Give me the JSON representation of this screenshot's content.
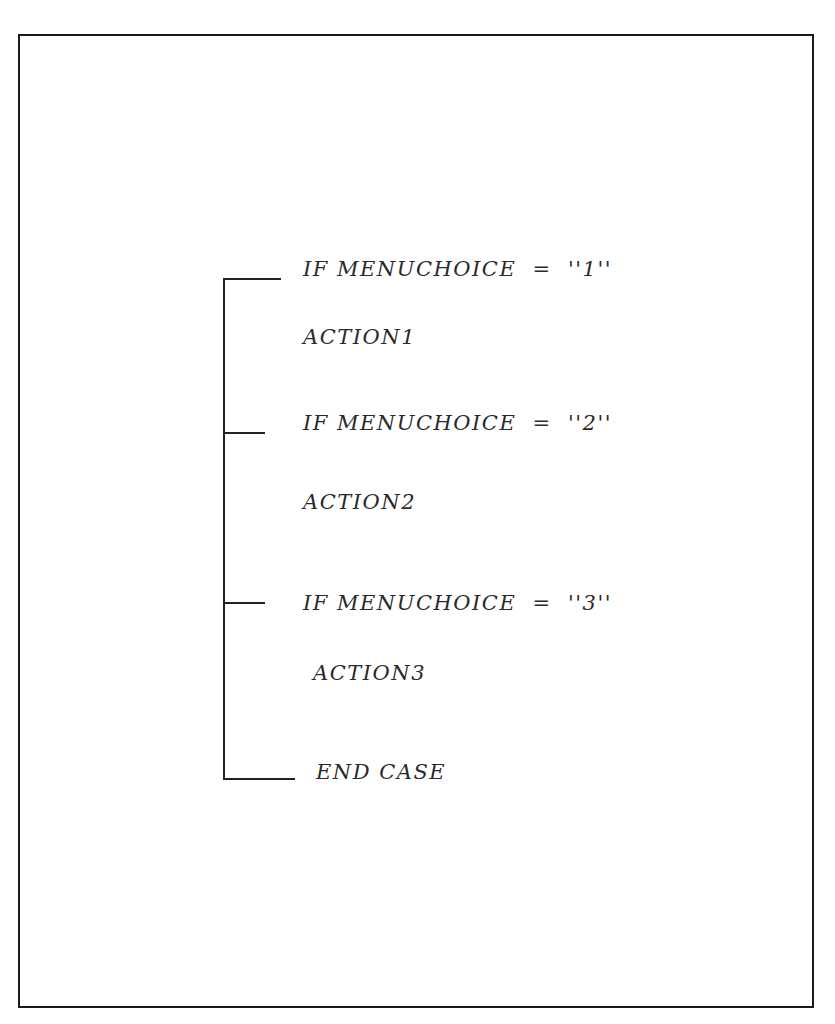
{
  "diagram": {
    "type": "case-structure-pseudocode",
    "lines": [
      {
        "id": "case1",
        "text": "IF MENUCHOICE  =  ''1''",
        "kind": "condition"
      },
      {
        "id": "action1",
        "text": "ACTION1",
        "kind": "action"
      },
      {
        "id": "case2",
        "text": "IF MENUCHOICE  =  ''2''",
        "kind": "condition"
      },
      {
        "id": "action2",
        "text": "ACTION2",
        "kind": "action"
      },
      {
        "id": "case3",
        "text": "IF MENUCHOICE  =  ''3''",
        "kind": "condition"
      },
      {
        "id": "action3",
        "text": "ACTION3",
        "kind": "action"
      },
      {
        "id": "end",
        "text": "END CASE",
        "kind": "terminator"
      }
    ],
    "colors": {
      "background": "#ffffff",
      "ink": "#222222",
      "text": "#2a2a2a"
    }
  }
}
